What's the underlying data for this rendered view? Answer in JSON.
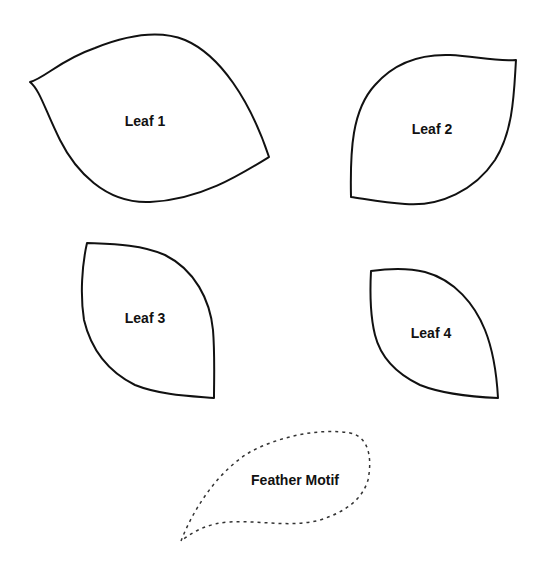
{
  "shapes": [
    {
      "label": "Leaf 1"
    },
    {
      "label": "Leaf 2"
    },
    {
      "label": "Leaf 3"
    },
    {
      "label": "Leaf 4"
    },
    {
      "label": "Feather Motif"
    }
  ],
  "colors": {
    "outline": "#111111",
    "background": "#ffffff"
  }
}
